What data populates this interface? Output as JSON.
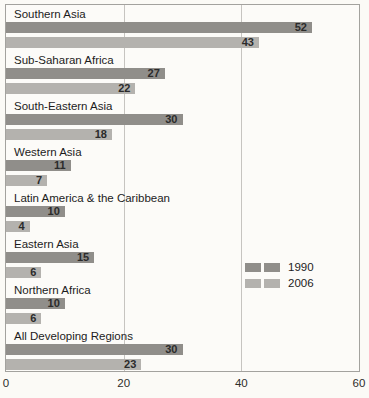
{
  "chart_data": {
    "type": "bar",
    "orientation": "horizontal",
    "categories": [
      "Southern Asia",
      "Sub-Saharan Africa",
      "South-Eastern Asia",
      "Western Asia",
      "Latin America & the Caribbean",
      "Eastern Asia",
      "Northern Africa",
      "All Developing Regions"
    ],
    "series": [
      {
        "name": "1990",
        "color": "#908e8a",
        "values": [
          52,
          27,
          30,
          11,
          10,
          15,
          10,
          30
        ]
      },
      {
        "name": "2006",
        "color": "#b4b2ae",
        "values": [
          43,
          22,
          18,
          7,
          4,
          6,
          6,
          23
        ]
      }
    ],
    "xlim": [
      0,
      60
    ],
    "xticks": [
      0,
      20,
      40,
      60
    ],
    "gridlines": [
      20,
      40
    ],
    "value_labels": "inside-end",
    "legend_position": "right-middle",
    "grid": "vertical-only",
    "title": "",
    "xlabel": "",
    "ylabel": ""
  },
  "legend": {
    "items": [
      {
        "label": "1990",
        "color": "#908e8a"
      },
      {
        "label": "2006",
        "color": "#b4b2ae"
      }
    ]
  },
  "colors": {
    "background": "#fbfaf6",
    "plot_background": "#fcfbf8",
    "border": "#a3a29e",
    "gridline": "#c6c4c0",
    "bar_1990": "#908e8a",
    "bar_2006": "#b4b2ae",
    "value_text": "#2b2b2b",
    "label_text": "#1c1c1c"
  }
}
